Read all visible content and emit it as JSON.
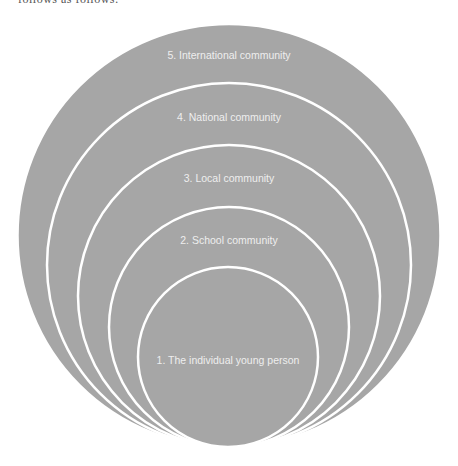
{
  "header": {
    "cut_text": "follows as follows:"
  },
  "diagram": {
    "type": "nested-circles",
    "fill_color": "#a6a6a6",
    "stroke_color": "#ffffff",
    "label_color": "#eeeeee",
    "levels": [
      {
        "label": "5. International community"
      },
      {
        "label": "4. National community"
      },
      {
        "label": "3. Local community"
      },
      {
        "label": "2. School community"
      },
      {
        "label": "1. The individual young person"
      }
    ]
  }
}
